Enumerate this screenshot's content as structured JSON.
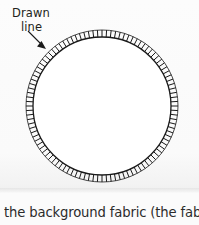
{
  "figure": {
    "kind": "appliqué-circle-diagram",
    "callout": {
      "line1": "Drawn",
      "line2": "line",
      "target": "circle-stitched-edge"
    },
    "circle": {
      "center_x": 102,
      "center_y": 106,
      "radius": 69,
      "outline_color": "#1a1a1a",
      "fill_color": "#ffffff",
      "outline_width": 1.3
    },
    "stitches": {
      "name": "blanket-stitch-marks",
      "count": 104,
      "length": 7,
      "color": "#1a1a1a",
      "width": 1.0,
      "direction": "outward-radial"
    },
    "arrow": {
      "name": "callout-arrow",
      "from_x": 28,
      "from_y": 31,
      "to_x": 45,
      "to_y": 48,
      "color": "#1a1a1a"
    }
  },
  "body": {
    "text": "the background fabric (the fabric vo"
  },
  "colors": {
    "page_background": "#fbfbfb",
    "ink": "#231f20",
    "body_ink": "#2b2b2b"
  }
}
